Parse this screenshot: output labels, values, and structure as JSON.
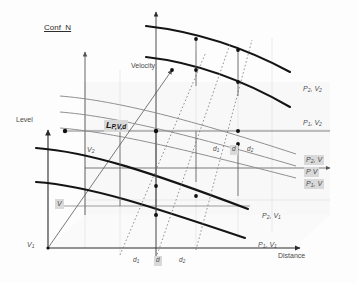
{
  "figure": {
    "title": "Conf_N",
    "background": "#fdfdfd",
    "ink": "#333333",
    "grid_color": "#a9a9a9",
    "highlight_color": "#d9d9d9"
  },
  "axes": {
    "vertical": {
      "name": "Level",
      "label": "Level"
    },
    "horizontal": {
      "name": "Distance",
      "label": "Distance"
    },
    "depth": {
      "name": "Velocity",
      "label": "Velocity"
    }
  },
  "origin_label": {
    "base": "V",
    "sub": "1"
  },
  "center_label": {
    "base": "L",
    "sub": "P,V,d"
  },
  "velocity_marks": [
    {
      "base": "V",
      "sub": "2",
      "x": 87,
      "y": 146
    },
    {
      "base": "V",
      "sub": "",
      "x": 55,
      "y": 199
    }
  ],
  "distance_ticks": [
    {
      "base": "d",
      "sub": "1",
      "x": 133,
      "y": 257
    },
    {
      "base": "d",
      "sub": "",
      "x": 156,
      "y": 257
    },
    {
      "base": "d",
      "sub": "2",
      "x": 179,
      "y": 257
    }
  ],
  "inner_marks": [
    {
      "base": "d",
      "sub": "1",
      "x": 213,
      "y": 148
    },
    {
      "base": "d",
      "sub": "",
      "x": 229,
      "y": 148
    },
    {
      "base": "d",
      "sub": "2",
      "x": 246,
      "y": 148
    }
  ],
  "curve_labels": [
    {
      "id": "p2v2",
      "base": "P",
      "sub": "2",
      "base2": "V",
      "sub2": "2",
      "x": 303,
      "y": 87,
      "highlight": false
    },
    {
      "id": "p1v2",
      "base": "P",
      "sub": "1",
      "base2": "V",
      "sub2": "2",
      "x": 303,
      "y": 120,
      "highlight": false
    },
    {
      "id": "p2v",
      "base": "P",
      "sub": "2",
      "base2": "V",
      "sub2": "",
      "x": 304,
      "y": 158,
      "highlight": true
    },
    {
      "id": "pv",
      "base": "P",
      "sub": "",
      "base2": "V",
      "sub2": "",
      "x": 304,
      "y": 170,
      "highlight": true
    },
    {
      "id": "p1v",
      "base": "P",
      "sub": "1",
      "base2": "V",
      "sub2": "",
      "x": 304,
      "y": 182,
      "highlight": true
    },
    {
      "id": "p2v1",
      "base": "P",
      "sub": "2",
      "base2": "V",
      "sub2": "1",
      "x": 262,
      "y": 214,
      "highlight": false
    },
    {
      "id": "p1v1",
      "base": "P",
      "sub": "1",
      "base2": "V",
      "sub2": "1",
      "x": 258,
      "y": 243,
      "highlight": false
    }
  ]
}
